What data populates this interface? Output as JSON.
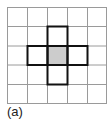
{
  "figure": {
    "caption": "(a)",
    "grid": {
      "rows": 5,
      "cols": 5,
      "line_color": "#9a9a9a"
    },
    "center_cell": {
      "row": 2,
      "col": 2,
      "fill": "#cccccc"
    },
    "neighborhood": {
      "type": "von-neumann",
      "cells": [
        [
          1,
          2
        ],
        [
          2,
          1
        ],
        [
          2,
          2
        ],
        [
          2,
          3
        ],
        [
          3,
          2
        ]
      ],
      "outline_color": "#111111"
    }
  }
}
